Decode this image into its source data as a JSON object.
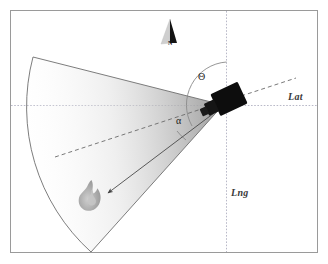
{
  "figure": {
    "background_color": "#ffffff",
    "frame_color": "#9a9a9a"
  },
  "axes": {
    "lat_label": "Lat",
    "lng_label": "Lng",
    "axis_color": "#b9b9c8",
    "lat_line_y": 105,
    "lng_line_x": 226,
    "lat_label_pos": {
      "x": 288,
      "y": 99
    },
    "lng_label_pos": {
      "x": 231,
      "y": 194
    }
  },
  "compass": {
    "name": "north-arrow",
    "label": "N",
    "tip": {
      "x": 170,
      "y": 19
    },
    "base": {
      "x": 163,
      "y": 44
    },
    "dark_color": "#121212",
    "light_color": "#c9c9c9"
  },
  "camera": {
    "name": "camera-sensor",
    "position": {
      "x": 223,
      "y": 105
    },
    "rotation_deg": -25,
    "body_color": "#0d0d0d",
    "lens_color": "#1a1a1a"
  },
  "fov": {
    "name": "field-of-view-sector",
    "apex": {
      "x": 223,
      "y": 105
    },
    "edge_upper": {
      "x": 33,
      "y": 57
    },
    "edge_lower": {
      "x": 91,
      "y": 252
    },
    "arc_radius": 196,
    "outline_color": "#6e6e6e",
    "fill_from": "#9a9a9a",
    "fill_to": "#ffffff"
  },
  "bearing_axis": {
    "name": "optical-axis-dashed",
    "style": "dashed",
    "color": "#6a6a6a",
    "from": {
      "x": 55,
      "y": 157
    },
    "to": {
      "x": 296,
      "y": 78
    }
  },
  "target_ray": {
    "name": "target-bearing-arrow",
    "color": "#4a4a4a",
    "from": {
      "x": 222,
      "y": 107
    },
    "to": {
      "x": 106,
      "y": 194
    }
  },
  "angles": {
    "theta": {
      "name": "theta-angle",
      "symbol": "Θ",
      "label_pos": {
        "x": 201,
        "y": 78
      },
      "arc_color": "#7a7a7a",
      "description": "bearing of camera optical axis measured from north"
    },
    "alpha": {
      "name": "alpha-angle",
      "symbol": "α",
      "label_pos": {
        "x": 178,
        "y": 121
      },
      "arc_color": "#7a7a7a",
      "description": "offset angle between optical axis and target ray"
    }
  },
  "fire": {
    "name": "fire-target-icon",
    "position": {
      "x": 90,
      "y": 200
    },
    "color_outer": "#9b9b9b",
    "color_inner": "#bdbdbd"
  }
}
